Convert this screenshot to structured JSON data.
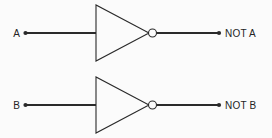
{
  "diagram": {
    "background_color": "#fbfbfb",
    "line_color": "#2a2a2a",
    "text_color": "#242424",
    "gates": [
      {
        "type": "NOT",
        "input_label": "A",
        "output_label": "NOT A",
        "input_terminal_dot": true,
        "output_terminal_dot": true,
        "bubble": true
      },
      {
        "type": "NOT",
        "input_label": "B",
        "output_label": "NOT B",
        "input_terminal_dot": true,
        "output_terminal_dot": true,
        "bubble": true
      }
    ]
  }
}
